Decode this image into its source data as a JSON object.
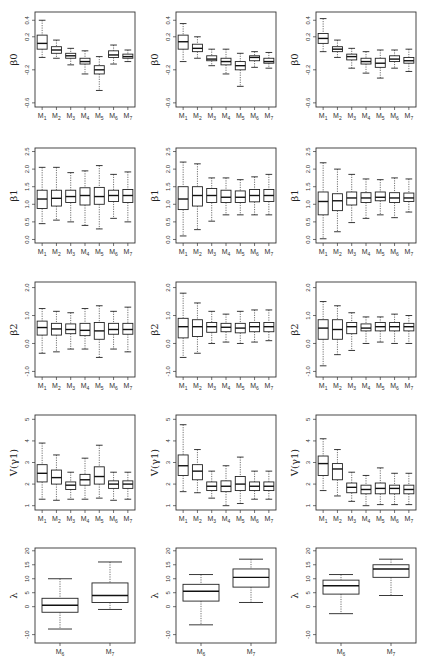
{
  "chart_data": {
    "type": "boxplot",
    "layout": {
      "rows": 5,
      "cols": 3
    },
    "categories": [
      "M1",
      "M2",
      "M3",
      "M4",
      "M5",
      "M6",
      "M7"
    ],
    "panels": [
      {
        "row": 0,
        "col": 0,
        "ylabel": "β0",
        "yticks": [
          0.4,
          0.2,
          -0.2,
          -0.6
        ],
        "ylim": [
          -0.65,
          0.5
        ],
        "boxes": [
          [
            -0.05,
            0.05,
            0.12,
            0.22,
            0.4
          ],
          [
            -0.06,
            0.0,
            0.04,
            0.08,
            0.16
          ],
          [
            -0.14,
            -0.06,
            -0.03,
            0.0,
            0.06
          ],
          [
            -0.25,
            -0.13,
            -0.1,
            -0.06,
            0.03
          ],
          [
            -0.45,
            -0.25,
            -0.2,
            -0.15,
            -0.04
          ],
          [
            -0.13,
            -0.05,
            -0.02,
            0.03,
            0.1
          ],
          [
            -0.1,
            -0.06,
            -0.04,
            -0.01,
            0.04
          ]
        ]
      },
      {
        "row": 0,
        "col": 1,
        "ylabel": "β0",
        "yticks": [
          0.4,
          0.2,
          -0.2,
          -0.6
        ],
        "ylim": [
          -0.65,
          0.5
        ],
        "boxes": [
          [
            -0.1,
            0.05,
            0.14,
            0.22,
            0.36
          ],
          [
            -0.06,
            0.02,
            0.06,
            0.11,
            0.2
          ],
          [
            -0.15,
            -0.09,
            -0.07,
            -0.03,
            0.05
          ],
          [
            -0.25,
            -0.14,
            -0.1,
            -0.06,
            0.05
          ],
          [
            -0.4,
            -0.2,
            -0.15,
            -0.1,
            0.0
          ],
          [
            -0.17,
            -0.09,
            -0.05,
            -0.03,
            0.02
          ],
          [
            -0.18,
            -0.12,
            -0.1,
            -0.06,
            0.01
          ]
        ]
      },
      {
        "row": 0,
        "col": 2,
        "ylabel": "β0",
        "yticks": [
          0.4,
          0.2,
          -0.2,
          -0.6
        ],
        "ylim": [
          -0.65,
          0.5
        ],
        "boxes": [
          [
            0.02,
            0.12,
            0.18,
            0.24,
            0.42
          ],
          [
            -0.05,
            0.02,
            0.05,
            0.08,
            0.16
          ],
          [
            -0.18,
            -0.08,
            -0.04,
            -0.01,
            0.06
          ],
          [
            -0.24,
            -0.13,
            -0.1,
            -0.06,
            0.02
          ],
          [
            -0.3,
            -0.17,
            -0.12,
            -0.06,
            0.04
          ],
          [
            -0.18,
            -0.1,
            -0.07,
            -0.03,
            0.04
          ],
          [
            -0.22,
            -0.12,
            -0.09,
            -0.05,
            0.05
          ]
        ]
      },
      {
        "row": 1,
        "col": 0,
        "ylabel": "β1",
        "yticks": [
          0.0,
          0.5,
          1.0,
          1.5,
          2.0,
          2.5
        ],
        "ylim": [
          -0.1,
          2.6
        ],
        "boxes": [
          [
            0.45,
            0.88,
            1.15,
            1.4,
            2.05
          ],
          [
            0.55,
            0.95,
            1.17,
            1.4,
            2.05
          ],
          [
            0.5,
            1.05,
            1.22,
            1.4,
            1.9
          ],
          [
            0.4,
            0.98,
            1.25,
            1.47,
            1.95
          ],
          [
            0.3,
            1.0,
            1.22,
            1.48,
            2.1
          ],
          [
            0.6,
            1.08,
            1.25,
            1.4,
            1.85
          ],
          [
            0.5,
            1.05,
            1.25,
            1.42,
            1.92
          ]
        ]
      },
      {
        "row": 1,
        "col": 1,
        "ylabel": "β1",
        "yticks": [
          0.0,
          0.5,
          1.0,
          1.5,
          2.0,
          2.5
        ],
        "ylim": [
          -0.1,
          2.6
        ],
        "boxes": [
          [
            0.1,
            0.85,
            1.15,
            1.5,
            2.2
          ],
          [
            0.28,
            0.95,
            1.25,
            1.5,
            2.15
          ],
          [
            0.52,
            1.05,
            1.25,
            1.45,
            1.75
          ],
          [
            0.7,
            1.05,
            1.2,
            1.4,
            1.75
          ],
          [
            0.7,
            1.05,
            1.2,
            1.38,
            1.7
          ],
          [
            0.7,
            1.07,
            1.25,
            1.42,
            1.78
          ],
          [
            0.7,
            1.08,
            1.25,
            1.42,
            1.85
          ]
        ]
      },
      {
        "row": 1,
        "col": 2,
        "ylabel": "β1",
        "yticks": [
          0.0,
          0.5,
          1.0,
          1.5,
          2.0,
          2.5
        ],
        "ylim": [
          -0.1,
          2.6
        ],
        "boxes": [
          [
            0.02,
            0.7,
            1.08,
            1.35,
            2.18
          ],
          [
            0.22,
            0.82,
            1.1,
            1.3,
            2.0
          ],
          [
            0.48,
            0.98,
            1.18,
            1.35,
            1.85
          ],
          [
            0.6,
            1.05,
            1.18,
            1.33,
            1.72
          ],
          [
            0.7,
            1.1,
            1.2,
            1.35,
            1.7
          ],
          [
            0.62,
            1.05,
            1.18,
            1.33,
            1.75
          ],
          [
            0.78,
            1.08,
            1.18,
            1.32,
            1.72
          ]
        ]
      },
      {
        "row": 2,
        "col": 0,
        "ylabel": "β2",
        "yticks": [
          -1.0,
          0.0,
          1.0,
          2.0
        ],
        "ylim": [
          -1.2,
          2.2
        ],
        "boxes": [
          [
            -0.35,
            0.3,
            0.57,
            0.8,
            1.25
          ],
          [
            -0.3,
            0.3,
            0.52,
            0.72,
            1.15
          ],
          [
            -0.2,
            0.35,
            0.5,
            0.7,
            1.1
          ],
          [
            -0.2,
            0.28,
            0.47,
            0.72,
            1.25
          ],
          [
            -0.5,
            0.15,
            0.45,
            0.75,
            1.35
          ],
          [
            -0.2,
            0.33,
            0.5,
            0.72,
            1.15
          ],
          [
            -0.3,
            0.33,
            0.5,
            0.72,
            1.3
          ]
        ]
      },
      {
        "row": 2,
        "col": 1,
        "ylabel": "β2",
        "yticks": [
          -1.0,
          0.0,
          1.0,
          2.0
        ],
        "ylim": [
          -1.2,
          2.2
        ],
        "boxes": [
          [
            -0.5,
            0.2,
            0.6,
            0.9,
            1.8
          ],
          [
            -0.35,
            0.25,
            0.6,
            0.85,
            1.45
          ],
          [
            0.0,
            0.4,
            0.6,
            0.75,
            1.15
          ],
          [
            0.05,
            0.42,
            0.58,
            0.72,
            1.05
          ],
          [
            0.0,
            0.38,
            0.55,
            0.72,
            1.15
          ],
          [
            0.05,
            0.42,
            0.6,
            0.75,
            1.2
          ],
          [
            0.1,
            0.42,
            0.6,
            0.75,
            1.2
          ]
        ]
      },
      {
        "row": 2,
        "col": 2,
        "ylabel": "β2",
        "yticks": [
          -1.0,
          0.0,
          1.0,
          2.0
        ],
        "ylim": [
          -1.2,
          2.2
        ],
        "boxes": [
          [
            -0.8,
            0.15,
            0.55,
            0.85,
            1.5
          ],
          [
            -0.4,
            0.15,
            0.5,
            0.85,
            1.35
          ],
          [
            -0.25,
            0.35,
            0.6,
            0.75,
            1.1
          ],
          [
            0.0,
            0.45,
            0.55,
            0.7,
            0.95
          ],
          [
            0.05,
            0.45,
            0.6,
            0.75,
            0.95
          ],
          [
            0.0,
            0.45,
            0.6,
            0.75,
            1.05
          ],
          [
            0.0,
            0.45,
            0.6,
            0.72,
            1.0
          ]
        ]
      },
      {
        "row": 3,
        "col": 0,
        "ylabel": "V(γ1)",
        "yticks": [
          1,
          2,
          3,
          4,
          5
        ],
        "ylim": [
          0.8,
          5.2
        ],
        "boxes": [
          [
            1.3,
            2.1,
            2.5,
            2.9,
            3.9
          ],
          [
            1.25,
            2.0,
            2.3,
            2.65,
            3.35
          ],
          [
            1.3,
            1.75,
            1.95,
            2.1,
            2.55
          ],
          [
            1.3,
            1.95,
            2.2,
            2.45,
            3.2
          ],
          [
            1.35,
            2.0,
            2.35,
            2.8,
            3.8
          ],
          [
            1.25,
            1.8,
            2.0,
            2.15,
            2.55
          ],
          [
            1.3,
            1.8,
            2.0,
            2.15,
            2.55
          ]
        ]
      },
      {
        "row": 3,
        "col": 1,
        "ylabel": "V(γ1)",
        "yticks": [
          1,
          2,
          3,
          4,
          5
        ],
        "ylim": [
          0.8,
          5.2
        ],
        "boxes": [
          [
            1.65,
            2.4,
            2.85,
            3.35,
            4.75
          ],
          [
            1.6,
            2.2,
            2.6,
            2.9,
            3.6
          ],
          [
            1.35,
            1.7,
            1.9,
            2.1,
            2.6
          ],
          [
            1.0,
            1.65,
            1.9,
            2.15,
            2.85
          ],
          [
            1.1,
            1.7,
            2.0,
            2.35,
            3.25
          ],
          [
            1.3,
            1.7,
            1.9,
            2.1,
            2.6
          ],
          [
            1.3,
            1.7,
            1.9,
            2.1,
            2.6
          ]
        ]
      },
      {
        "row": 3,
        "col": 2,
        "ylabel": "V(γ1)",
        "yticks": [
          1,
          2,
          3,
          4,
          5
        ],
        "ylim": [
          0.8,
          5.2
        ],
        "boxes": [
          [
            1.7,
            2.4,
            2.95,
            3.3,
            4.1
          ],
          [
            1.45,
            2.2,
            2.7,
            2.95,
            3.6
          ],
          [
            1.2,
            1.6,
            1.85,
            2.05,
            2.55
          ],
          [
            1.0,
            1.55,
            1.75,
            1.95,
            2.4
          ],
          [
            1.05,
            1.55,
            1.8,
            2.05,
            2.75
          ],
          [
            1.05,
            1.55,
            1.8,
            1.95,
            2.5
          ],
          [
            1.05,
            1.55,
            1.75,
            1.95,
            2.5
          ]
        ]
      },
      {
        "row": 4,
        "col": 0,
        "ylabel": "λ",
        "categories": [
          "M6",
          "M7"
        ],
        "yticks": [
          -10,
          0,
          5,
          10,
          15,
          20
        ],
        "ylim": [
          -13,
          21
        ],
        "boxes": [
          [
            -8,
            -2,
            0.5,
            3,
            10
          ],
          [
            -1,
            1.5,
            4,
            8.5,
            16
          ]
        ]
      },
      {
        "row": 4,
        "col": 1,
        "ylabel": "λ",
        "categories": [
          "M6",
          "M7"
        ],
        "yticks": [
          -10,
          0,
          5,
          10,
          15,
          20
        ],
        "ylim": [
          -13,
          21
        ],
        "boxes": [
          [
            -6.5,
            2,
            5.5,
            8,
            11.5
          ],
          [
            1.5,
            7,
            10.5,
            13.5,
            17
          ]
        ]
      },
      {
        "row": 4,
        "col": 2,
        "ylabel": "λ",
        "categories": [
          "M6",
          "M7"
        ],
        "yticks": [
          -10,
          0,
          5,
          10,
          15,
          20
        ],
        "ylim": [
          -13,
          21
        ],
        "boxes": [
          [
            -2.5,
            4.5,
            7.5,
            9.5,
            11.5
          ],
          [
            4,
            10.5,
            13.5,
            15,
            17
          ]
        ]
      }
    ],
    "title": "",
    "xlabel": "",
    "grid": false
  }
}
